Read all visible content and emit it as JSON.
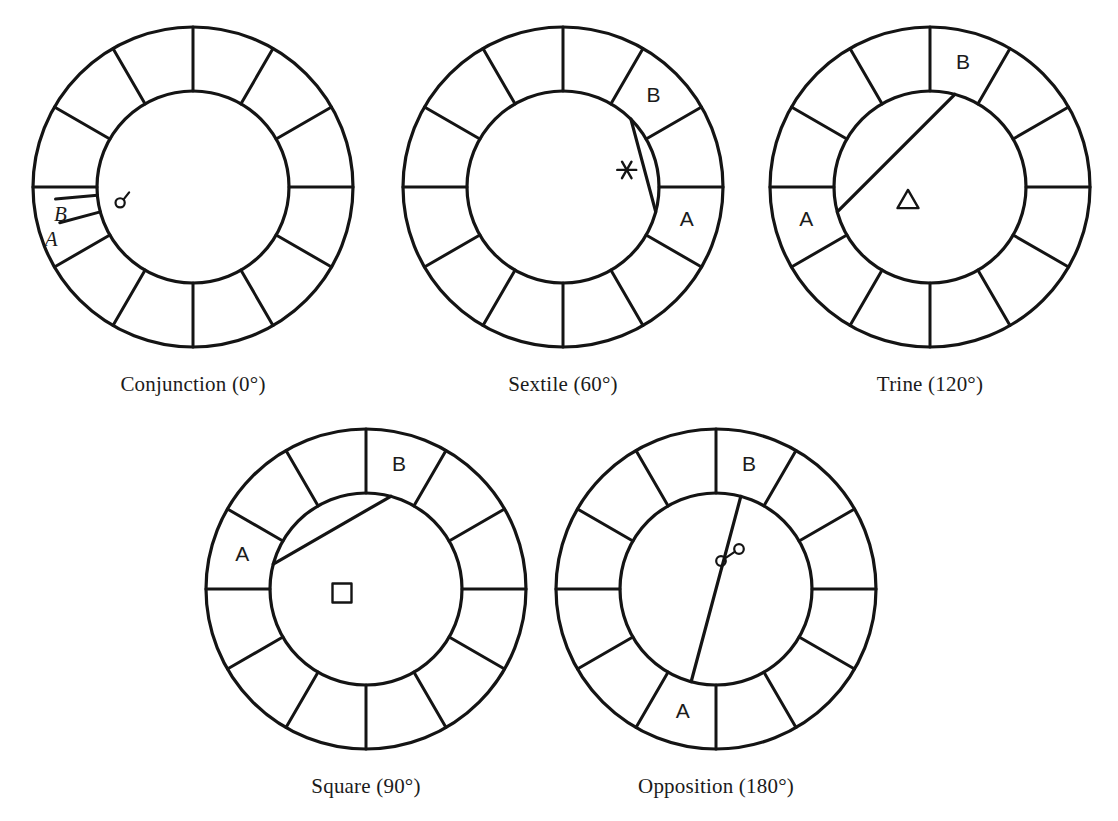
{
  "figure": {
    "background_color": "#ffffff",
    "line_color": "#141414",
    "text_color": "#1b1b1b",
    "sector_count": 12,
    "bottom_caption": ""
  },
  "diagrams": [
    {
      "id": "conjunction",
      "caption": "Conjunction (0°)",
      "aspect_name": "Conjunction",
      "angle_label": "0°",
      "angle_degrees": 0,
      "symbol_name": "conjunction-symbol",
      "symbol_char": "☌",
      "labels": [
        {
          "text": "A",
          "style": "italic-serif"
        },
        {
          "text": "B",
          "style": "italic-serif"
        }
      ],
      "marker_style": "two-radial-ticks",
      "planet_a_degrees": 255,
      "planet_b_degrees": 265,
      "center": {
        "x": 193,
        "y": 187
      },
      "outer_radius": 160,
      "inner_radius": 96,
      "caption_y": 372
    },
    {
      "id": "sextile",
      "caption": "Sextile (60°)",
      "aspect_name": "Sextile",
      "angle_label": "60°",
      "angle_degrees": 60,
      "symbol_name": "sextile-symbol",
      "symbol_char": "⚹",
      "labels": [
        {
          "text": "A",
          "style": "sans"
        },
        {
          "text": "B",
          "style": "sans"
        }
      ],
      "marker_style": "chord",
      "planet_a_degrees": 105,
      "planet_b_degrees": 45,
      "center": {
        "x": 563,
        "y": 187
      },
      "outer_radius": 160,
      "inner_radius": 96,
      "caption_y": 372
    },
    {
      "id": "trine",
      "caption": "Trine (120°)",
      "aspect_name": "Trine",
      "angle_label": "120°",
      "angle_degrees": 120,
      "symbol_name": "trine-symbol",
      "symbol_char": "△",
      "labels": [
        {
          "text": "A",
          "style": "sans"
        },
        {
          "text": "B",
          "style": "sans"
        }
      ],
      "marker_style": "chord",
      "planet_a_degrees": 255,
      "planet_b_degrees": 15,
      "center": {
        "x": 930,
        "y": 187
      },
      "outer_radius": 160,
      "inner_radius": 96,
      "caption_y": 372
    },
    {
      "id": "square",
      "caption": "Square (90°)",
      "aspect_name": "Square",
      "angle_label": "90°",
      "angle_degrees": 90,
      "symbol_name": "square-symbol",
      "symbol_char": "□",
      "labels": [
        {
          "text": "A",
          "style": "sans"
        },
        {
          "text": "B",
          "style": "sans"
        }
      ],
      "marker_style": "chord",
      "planet_a_degrees": 285,
      "planet_b_degrees": 15,
      "center": {
        "x": 366,
        "y": 589
      },
      "outer_radius": 160,
      "inner_radius": 96,
      "caption_y": 774
    },
    {
      "id": "opposition",
      "caption": "Opposition (180°)",
      "aspect_name": "Opposition",
      "angle_label": "180°",
      "angle_degrees": 180,
      "symbol_name": "opposition-symbol",
      "symbol_char": "☍",
      "labels": [
        {
          "text": "A",
          "style": "sans"
        },
        {
          "text": "B",
          "style": "sans"
        }
      ],
      "marker_style": "chord",
      "planet_a_degrees": 195,
      "planet_b_degrees": 15,
      "center": {
        "x": 716,
        "y": 589
      },
      "outer_radius": 160,
      "inner_radius": 96,
      "caption_y": 774
    }
  ]
}
